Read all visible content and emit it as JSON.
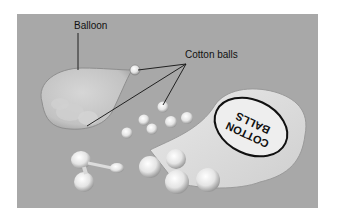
{
  "figure": {
    "labels": {
      "balloon": "Balloon",
      "cotton_balls": "Cotton balls"
    },
    "bag_text": {
      "line1": "COTTON",
      "line2": "BALLS"
    },
    "colors": {
      "background": "#a8a8a8",
      "frame_border": "#ffffff",
      "line": "#111111"
    }
  }
}
